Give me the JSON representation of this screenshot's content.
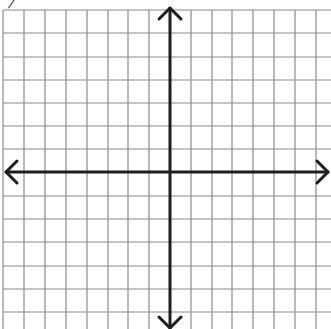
{
  "figure": {
    "type": "coordinate-plane",
    "corner_fragment": "/",
    "grid": {
      "vertical_lines_x": [
        3,
        24,
        45,
        66,
        87,
        108,
        128,
        149,
        191,
        212,
        232,
        253,
        274,
        295,
        316
      ],
      "horizontal_lines_y": [
        10,
        33,
        57,
        80,
        103,
        126,
        149,
        196,
        219,
        242,
        266,
        289,
        312
      ],
      "grid_top": 10,
      "grid_bottom": 329,
      "grid_left": 3,
      "grid_right": 331,
      "grid_color": "#8a8a8a",
      "grid_width": 1.2
    },
    "axes": {
      "origin_x": 170,
      "origin_y": 172,
      "x_axis_left": 6,
      "x_axis_right": 328,
      "y_axis_top": 8,
      "y_axis_bottom": 328,
      "axis_color": "#1e1e1e",
      "axis_width": 3,
      "arrows": [
        "left",
        "right",
        "up",
        "down"
      ]
    }
  }
}
